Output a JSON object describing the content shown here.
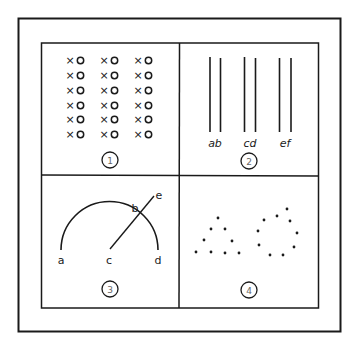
{
  "figure": {
    "colors": {
      "ink": "#1a1a1a",
      "background": "#ffffff",
      "numeral": "#666666"
    },
    "panels": [
      {
        "number": "1",
        "description": "grid of x o pairs",
        "marks": {
          "x": "×",
          "o": "o"
        },
        "rows": 6,
        "columns": 3
      },
      {
        "number": "2",
        "description": "three pairs of vertical lines",
        "labels": [
          "ab",
          "cd",
          "ef"
        ]
      },
      {
        "number": "3",
        "description": "semicircular arc crossed by a line",
        "labels": {
          "a": "a",
          "b": "b",
          "c": "c",
          "d": "d",
          "e": "e"
        }
      },
      {
        "number": "4",
        "description": "dots grouped into a triangle and a circle"
      }
    ]
  }
}
